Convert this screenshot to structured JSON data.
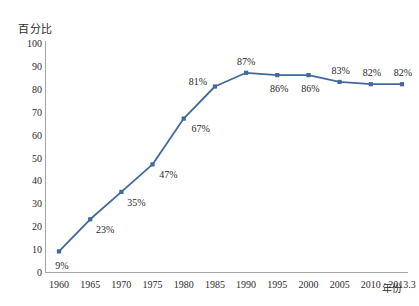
{
  "chart_data": {
    "type": "line",
    "title": "",
    "xlabel": "年份",
    "ylabel": "百分比",
    "ylim": [
      0,
      100
    ],
    "ytick_step": 10,
    "grid": false,
    "legend": "none",
    "marker": "square",
    "series_color": "#41699E",
    "categories": [
      "1960",
      "1965",
      "1970",
      "1975",
      "1980",
      "1985",
      "1990",
      "1995",
      "2000",
      "2005",
      "2010",
      "2013.3"
    ],
    "values": [
      9,
      23,
      35,
      47,
      67,
      81,
      87,
      86,
      86,
      83,
      82,
      82
    ],
    "point_labels": [
      "9%",
      "23%",
      "35%",
      "47%",
      "67%",
      "81%",
      "87%",
      "86%",
      "86%",
      "83%",
      "82%",
      "82%"
    ],
    "yticks": [
      "0",
      "10",
      "20",
      "30",
      "40",
      "50",
      "60",
      "70",
      "80",
      "90",
      "100"
    ]
  },
  "axes": {
    "y_title": "百分比",
    "x_title": "年份"
  }
}
